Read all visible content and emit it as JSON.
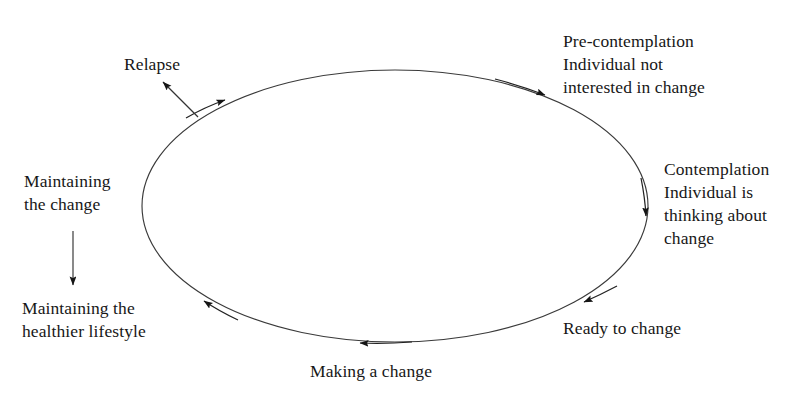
{
  "diagram": {
    "type": "cycle-diagram",
    "stroke_color": "#333333",
    "text_color": "#171717",
    "background_color": "#ffffff",
    "labels": {
      "precontemplation": "Pre-contemplation\nIndividual not\ninterested in change",
      "contemplation": "Contemplation\nIndividual is\nthinking about\nchange",
      "ready_to_change": "Ready to change",
      "making_a_change": "Making a change",
      "maintaining_healthier_lifestyle": "Maintaining the\nhealthier lifestyle",
      "maintaining_the_change": "Maintaining\nthe change",
      "relapse": "Relapse"
    },
    "stages_order": [
      "Pre-contemplation",
      "Contemplation",
      "Ready to change",
      "Making a change",
      "Maintaining the change",
      "Relapse"
    ],
    "ellipse": {
      "cx": 395,
      "cy": 206,
      "rx": 253,
      "ry": 136
    },
    "arrowheads_on_cycle": [
      {
        "name": "arrow-toward-precontemplation",
        "x": 545,
        "y": 94,
        "angle": -334
      },
      {
        "name": "arrow-toward-contemplation",
        "x": 646,
        "y": 217,
        "angle": 90
      },
      {
        "name": "arrow-toward-ready-to-change",
        "x": 582,
        "y": 301,
        "angle": 150
      },
      {
        "name": "arrow-toward-making-a-change",
        "x": 357,
        "y": 343,
        "angle": 180
      },
      {
        "name": "arrow-toward-maintaining",
        "x": 202,
        "y": 300,
        "angle": 216
      },
      {
        "name": "arrow-toward-relapse-point",
        "x": 226,
        "y": 99,
        "angle": -25
      }
    ],
    "relapse_arrow": {
      "from_x": 198,
      "from_y": 117,
      "to_x": 161,
      "to_y": 80
    },
    "maintaining_arrow": {
      "from_x": 73,
      "from_y": 231,
      "to_x": 73,
      "to_y": 287
    }
  }
}
